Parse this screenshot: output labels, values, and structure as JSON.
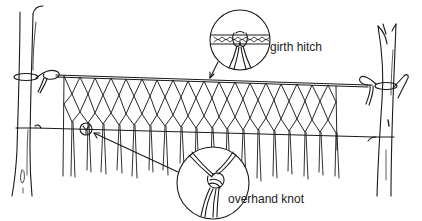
{
  "diagram": {
    "callouts": [
      {
        "id": "girth",
        "label": "girth hitch",
        "circle": {
          "cx": 240,
          "cy": 40,
          "r": 30
        }
      },
      {
        "id": "overhand",
        "label": "overhand knot",
        "circle": {
          "cx": 213,
          "cy": 183,
          "r": 36
        }
      }
    ],
    "colors": {
      "ink": "#1a1a1a",
      "background": "#ffffff"
    }
  }
}
